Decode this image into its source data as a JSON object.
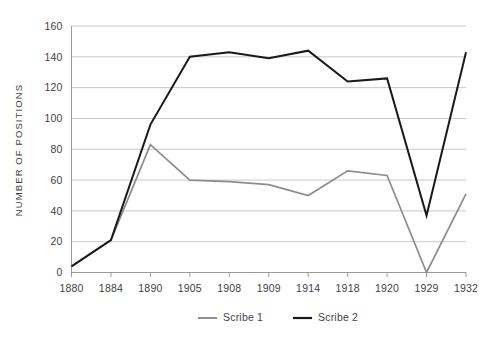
{
  "chart_data": {
    "type": "line",
    "title": "",
    "subtitle": "",
    "xlabel": "",
    "ylabel": "NUMBER OF POSITIONS",
    "categories": [
      "1880",
      "1884",
      "1890",
      "1905",
      "1908",
      "1909",
      "1914",
      "1918",
      "1920",
      "1929",
      "1932"
    ],
    "ylim": [
      0,
      160
    ],
    "ytick_values": [
      0,
      20,
      40,
      60,
      80,
      100,
      120,
      140,
      160
    ],
    "ytick_labels": [
      "0",
      "20",
      "40",
      "60",
      "80",
      "100",
      "120",
      "140",
      "160"
    ],
    "grid": true,
    "legend_position": "bottom",
    "series": [
      {
        "name": "Scribe 1",
        "color": "#8c8c8c",
        "values": [
          4,
          21,
          83,
          60,
          59,
          57,
          50,
          66,
          63,
          0,
          51
        ]
      },
      {
        "name": "Scribe 2",
        "color": "#1a1a1a",
        "values": [
          4,
          21,
          96,
          140,
          143,
          139,
          144,
          124,
          126,
          37,
          143
        ]
      }
    ]
  },
  "legend": {
    "items": [
      {
        "label": "Scribe 1",
        "swatch_name": "legend-swatch-scribe-1"
      },
      {
        "label": "Scribe 2",
        "swatch_name": "legend-swatch-scribe-2"
      }
    ]
  },
  "colors": {
    "background": "#ffffff",
    "gridline": "#b9b9b9",
    "axis": "#8e8e8e",
    "text": "#3f3f3f",
    "series_1": "#8c8c8c",
    "series_2": "#1a1a1a"
  }
}
